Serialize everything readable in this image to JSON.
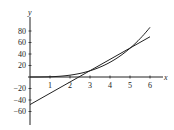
{
  "chart_data": {
    "type": "line",
    "title": "",
    "xlabel": "x",
    "ylabel": "y",
    "xlim": [
      0,
      6.5
    ],
    "ylim": [
      -70,
      100
    ],
    "x_ticks": [
      1,
      2,
      3,
      4,
      5,
      6
    ],
    "y_ticks": [
      80,
      60,
      40,
      20,
      -20,
      -40,
      -60
    ],
    "grid": false,
    "series": [
      {
        "name": "curve",
        "x": [
          0,
          1,
          2,
          3,
          4,
          5,
          6
        ],
        "values": [
          0,
          0.4,
          3.2,
          10.8,
          25.6,
          50,
          86.4
        ]
      },
      {
        "name": "tangent line",
        "x": [
          0,
          6
        ],
        "values": [
          -48,
          70
        ]
      }
    ]
  },
  "labels": {
    "x_axis": "x",
    "y_axis": "y",
    "x_tick_labels": [
      "1",
      "2",
      "3",
      "4",
      "5",
      "6"
    ],
    "y_tick_labels": [
      "80",
      "60",
      "40",
      "20",
      "−20",
      "−40",
      "−60"
    ]
  },
  "colors": {
    "line": "#222222"
  }
}
